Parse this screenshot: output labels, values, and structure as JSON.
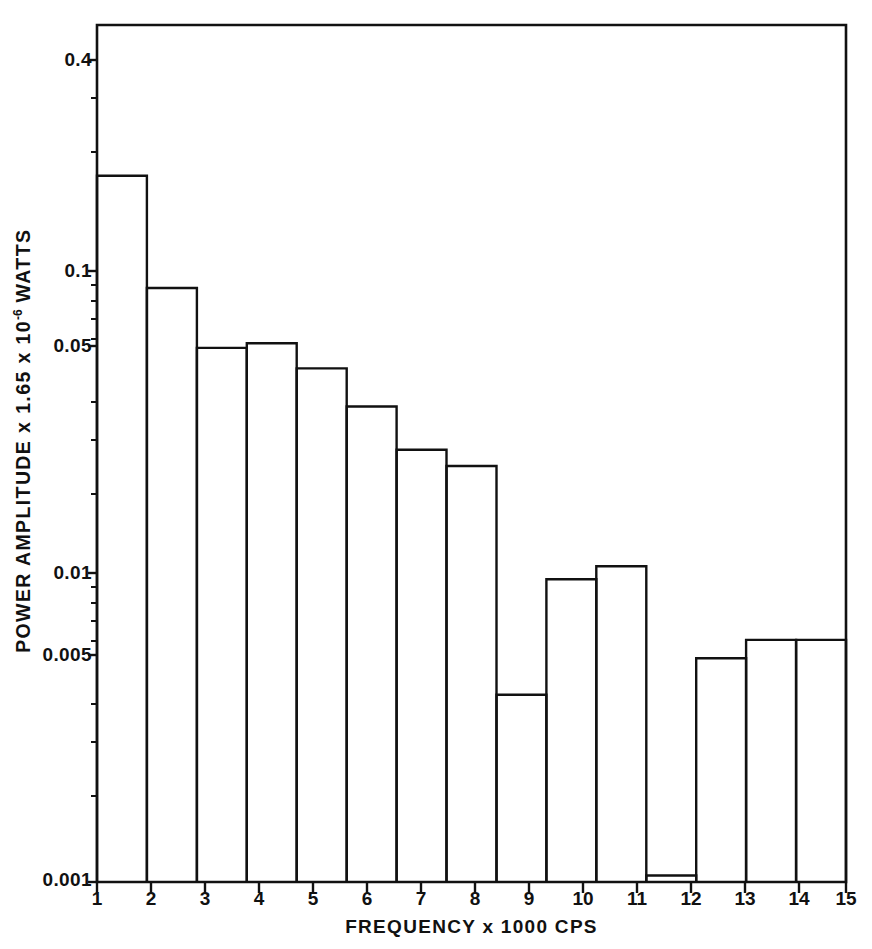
{
  "figure": {
    "background_color": "#ffffff",
    "ink_color": "#111111"
  },
  "chart_data": {
    "type": "bar",
    "title": "",
    "subtitle": "",
    "xlabel": "FREQUENCY  x 1000 CPS",
    "ylabel": "POWER AMPLITUDE x 1.65 x 10",
    "ylabel_exponent": "-6",
    "ylabel_unit": " WATTS",
    "ylabel_full": "POWER AMPLITUDE x 1.65 x 10^-6 WATTS",
    "yscale": "log",
    "xscale": "linear",
    "ylim": [
      0.001,
      0.45
    ],
    "xlim": [
      1,
      16
    ],
    "grid": false,
    "legend": null,
    "bar_style": {
      "fill": "none",
      "edge_color": "#111111",
      "edge_width": 1.8
    },
    "categories": [
      1,
      2,
      3,
      4,
      5,
      6,
      7,
      8,
      9,
      10,
      11,
      12,
      13,
      14,
      15
    ],
    "xtick_labels": [
      "1",
      "2",
      "3",
      "4",
      "5",
      "6",
      "7",
      "8",
      "9",
      "10",
      "11",
      "12",
      "13",
      "14",
      "15"
    ],
    "values": [
      0.205,
      0.088,
      0.056,
      0.058,
      0.048,
      0.036,
      0.026,
      0.023,
      0.0041,
      0.0098,
      0.0108,
      0.00105,
      0.0054,
      0.0062,
      0.0062
    ],
    "bar_count": 15,
    "ytick_values": [
      0.4,
      0.1,
      0.05,
      0.01,
      0.005,
      0.001
    ],
    "ytick_labels": [
      "0.4",
      "0.1",
      "0.05",
      "0.01",
      "0.005",
      "0.001"
    ],
    "yminor_ticks": [
      0.3,
      0.2,
      0.09,
      0.08,
      0.07,
      0.06,
      0.04,
      0.03,
      0.02,
      0.009,
      0.008,
      0.007,
      0.006,
      0.004,
      0.003,
      0.002
    ]
  },
  "axes": {
    "frame_left": 97,
    "frame_right": 846,
    "frame_top": 25,
    "frame_bottom": 882
  }
}
